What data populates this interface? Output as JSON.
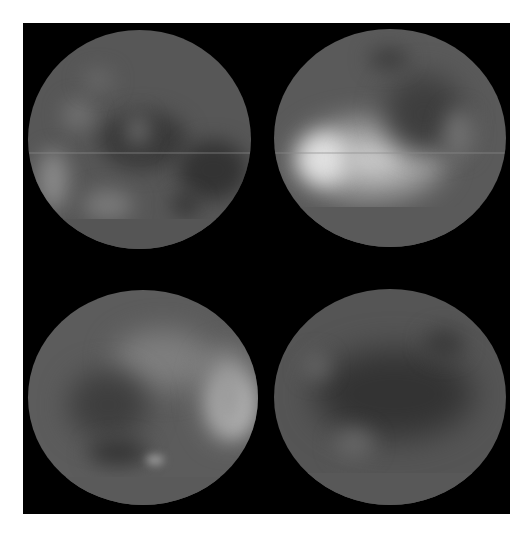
{
  "image": {
    "description": "Four grayscale disk maps arranged in a 2x2 grid on a black square over white background",
    "background_color": "#ffffff",
    "frame_color": "#000000",
    "disk_base_color": "#5a5a5a",
    "panels": [
      {
        "id": "top-left",
        "brightness": "dim"
      },
      {
        "id": "top-right",
        "brightness": "bright-left-center"
      },
      {
        "id": "bottom-left",
        "brightness": "bright-right-edge"
      },
      {
        "id": "bottom-right",
        "brightness": "dark"
      }
    ]
  }
}
